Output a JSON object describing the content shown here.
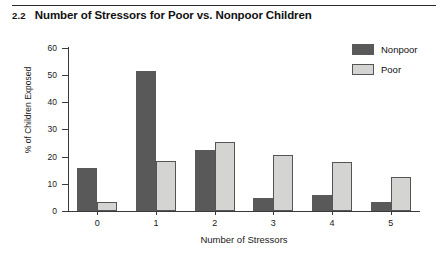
{
  "header": {
    "number": "2.2",
    "title": "Number of Stressors for Poor vs. Nonpoor Children"
  },
  "chart_data": {
    "type": "bar",
    "title": "Number of Stressors for Poor vs. Nonpoor Children",
    "xlabel": "Number of Stressors",
    "ylabel": "% of Children Exposed",
    "categories": [
      "0",
      "1",
      "2",
      "3",
      "4",
      "5"
    ],
    "series": [
      {
        "name": "Nonpoor",
        "color": "#595959",
        "values": [
          15.8,
          51.5,
          22.4,
          4.8,
          5.9,
          3.3
        ]
      },
      {
        "name": "Poor",
        "color": "#d4d4d2",
        "values": [
          3.3,
          18.2,
          25.3,
          20.7,
          18.1,
          12.5
        ]
      }
    ],
    "ylim": [
      0,
      60
    ],
    "yticks": [
      0,
      10,
      20,
      30,
      40,
      50,
      60
    ],
    "ytick_labels": [
      "0",
      "10",
      "20",
      "30",
      "40",
      "50",
      "60"
    ],
    "grid": false,
    "legend_position": "top-right"
  },
  "legend": {
    "entries": [
      {
        "label": "Nonpoor"
      },
      {
        "label": "Poor"
      }
    ]
  }
}
